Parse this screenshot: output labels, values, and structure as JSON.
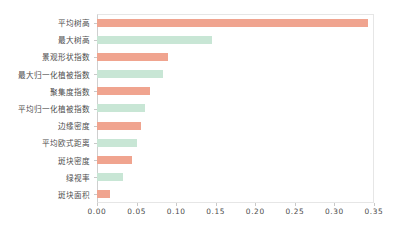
{
  "chart_data": {
    "type": "bar",
    "orientation": "horizontal",
    "title": "",
    "subtitle": "",
    "xlabel": "",
    "ylabel": "",
    "xlim": [
      0.0,
      0.35
    ],
    "ylim": null,
    "grid": false,
    "legend": null,
    "xticks": [
      "0.00",
      "0.05",
      "0.10",
      "0.15",
      "0.20",
      "0.25",
      "0.30",
      "0.35"
    ],
    "xtick_values": [
      0.0,
      0.05,
      0.1,
      0.15,
      0.2,
      0.25,
      0.3,
      0.35
    ],
    "categories": [
      "平均树高",
      "最大树高",
      "景观形状指数",
      "最大归一化植被指数",
      "聚集度指数",
      "平均归一化植被指数",
      "边缘密度",
      "平均欧式距离",
      "斑块密度",
      "绿视率",
      "斑块面积"
    ],
    "values": [
      0.342,
      0.145,
      0.09,
      0.084,
      0.067,
      0.061,
      0.055,
      0.05,
      0.044,
      0.033,
      0.017
    ],
    "bar_colors": [
      "#f0a48f",
      "#c8e6d5",
      "#f0a48f",
      "#c8e6d5",
      "#f0a48f",
      "#c8e6d5",
      "#f0a48f",
      "#c8e6d5",
      "#f0a48f",
      "#c8e6d5",
      "#f0a48f"
    ]
  },
  "colors": {
    "salmon": "#f0a48f",
    "mint": "#c8e6d5",
    "axis_text": "#4d4d4d",
    "frame": "#e6e6e6",
    "background": "#ffffff"
  }
}
